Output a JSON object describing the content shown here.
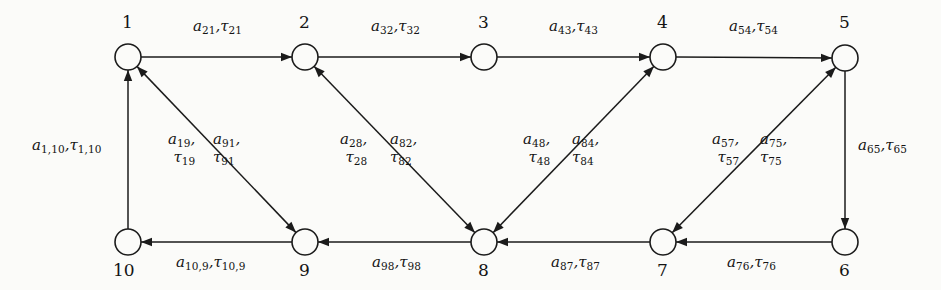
{
  "figure": {
    "type": "directed-graph",
    "background_color": "#fbfbf9",
    "ink_color": "#141414",
    "node_count": 10,
    "edge_count": 16
  },
  "nodes": [
    {
      "id": "1",
      "label": "1",
      "cx": 128,
      "cy": 57,
      "r": 13,
      "label_x": 122,
      "label_y": 14
    },
    {
      "id": "2",
      "label": "2",
      "cx": 305,
      "cy": 57,
      "r": 13,
      "label_x": 299,
      "label_y": 14
    },
    {
      "id": "3",
      "label": "3",
      "cx": 484,
      "cy": 57,
      "r": 13,
      "label_x": 478,
      "label_y": 14
    },
    {
      "id": "4",
      "label": "4",
      "cx": 663,
      "cy": 57,
      "r": 13,
      "label_x": 657,
      "label_y": 14
    },
    {
      "id": "5",
      "label": "5",
      "cx": 845,
      "cy": 58,
      "r": 13,
      "label_x": 839,
      "label_y": 14
    },
    {
      "id": "6",
      "label": "6",
      "cx": 845,
      "cy": 242,
      "r": 13,
      "label_x": 839,
      "label_y": 262
    },
    {
      "id": "7",
      "label": "7",
      "cx": 663,
      "cy": 242,
      "r": 13,
      "label_x": 657,
      "label_y": 262
    },
    {
      "id": "8",
      "label": "8",
      "cx": 484,
      "cy": 242,
      "r": 13,
      "label_x": 478,
      "label_y": 262
    },
    {
      "id": "9",
      "label": "9",
      "cx": 305,
      "cy": 242,
      "r": 13,
      "label_x": 299,
      "label_y": 262
    },
    {
      "id": "10",
      "label": "10",
      "cx": 128,
      "cy": 242,
      "r": 13,
      "label_x": 113,
      "label_y": 262
    }
  ],
  "edges": [
    {
      "id": "e-1-2",
      "from": "1",
      "to": "2",
      "direction": "forward"
    },
    {
      "id": "e-2-3",
      "from": "2",
      "to": "3",
      "direction": "forward"
    },
    {
      "id": "e-3-4",
      "from": "3",
      "to": "4",
      "direction": "forward"
    },
    {
      "id": "e-4-5",
      "from": "4",
      "to": "5",
      "direction": "forward"
    },
    {
      "id": "e-5-6",
      "from": "5",
      "to": "6",
      "direction": "forward"
    },
    {
      "id": "e-6-7",
      "from": "6",
      "to": "7",
      "direction": "forward"
    },
    {
      "id": "e-7-8",
      "from": "7",
      "to": "8",
      "direction": "forward"
    },
    {
      "id": "e-8-9",
      "from": "8",
      "to": "9",
      "direction": "forward"
    },
    {
      "id": "e-9-10",
      "from": "9",
      "to": "10",
      "direction": "forward"
    },
    {
      "id": "e-10-1",
      "from": "10",
      "to": "1",
      "direction": "forward"
    },
    {
      "id": "e-9-1",
      "from": "9",
      "to": "1",
      "direction": "both"
    },
    {
      "id": "e-8-2",
      "from": "8",
      "to": "2",
      "direction": "both"
    },
    {
      "id": "e-8-4",
      "from": "8",
      "to": "4",
      "direction": "both"
    },
    {
      "id": "e-7-5",
      "from": "7",
      "to": "5",
      "direction": "both"
    }
  ],
  "labels": {
    "top": [
      {
        "name": "edge-label-21",
        "a": "a",
        "a_sub": "21",
        "t": "τ",
        "t_sub": "21",
        "x": 193,
        "y": 18
      },
      {
        "name": "edge-label-32",
        "a": "a",
        "a_sub": "32",
        "t": "τ",
        "t_sub": "32",
        "x": 371,
        "y": 18
      },
      {
        "name": "edge-label-43",
        "a": "a",
        "a_sub": "43",
        "t": "τ",
        "t_sub": "43",
        "x": 549,
        "y": 18
      },
      {
        "name": "edge-label-54",
        "a": "a",
        "a_sub": "54",
        "t": "τ",
        "t_sub": "54",
        "x": 729,
        "y": 18
      }
    ],
    "bottom": [
      {
        "name": "edge-label-10-9",
        "a": "a",
        "a_sub": "10,9",
        "t": "τ",
        "t_sub": "10,9",
        "x": 176,
        "y": 254
      },
      {
        "name": "edge-label-98",
        "a": "a",
        "a_sub": "98",
        "t": "τ",
        "t_sub": "98",
        "x": 372,
        "y": 254
      },
      {
        "name": "edge-label-87",
        "a": "a",
        "a_sub": "87",
        "t": "τ",
        "t_sub": "87",
        "x": 551,
        "y": 254
      },
      {
        "name": "edge-label-76",
        "a": "a",
        "a_sub": "76",
        "t": "τ",
        "t_sub": "76",
        "x": 727,
        "y": 254
      }
    ],
    "sides": [
      {
        "name": "edge-label-1-10",
        "a": "a",
        "a_sub": "1,10",
        "t": "τ",
        "t_sub": "1,10",
        "x": 32,
        "y": 137
      },
      {
        "name": "edge-label-65",
        "a": "a",
        "a_sub": "65",
        "t": "τ",
        "t_sub": "65",
        "x": 858,
        "y": 137
      }
    ],
    "diagonals": [
      {
        "name": "edge-label-19",
        "a": "a",
        "a_sub": "19",
        "t": "τ",
        "t_sub": "19",
        "x": 168,
        "y": 131,
        "align": "right"
      },
      {
        "name": "edge-label-91",
        "a": "a",
        "a_sub": "91",
        "t": "τ",
        "t_sub": "91",
        "x": 213,
        "y": 131,
        "align": "left"
      },
      {
        "name": "edge-label-28",
        "a": "a",
        "a_sub": "28",
        "t": "τ",
        "t_sub": "28",
        "x": 340,
        "y": 131,
        "align": "right"
      },
      {
        "name": "edge-label-82",
        "a": "a",
        "a_sub": "82",
        "t": "τ",
        "t_sub": "82",
        "x": 390,
        "y": 131,
        "align": "left"
      },
      {
        "name": "edge-label-48",
        "a": "a",
        "a_sub": "48",
        "t": "τ",
        "t_sub": "48",
        "x": 523,
        "y": 131,
        "align": "right"
      },
      {
        "name": "edge-label-84",
        "a": "a",
        "a_sub": "84",
        "t": "τ",
        "t_sub": "84",
        "x": 572,
        "y": 131,
        "align": "left"
      },
      {
        "name": "edge-label-57",
        "a": "a",
        "a_sub": "57",
        "t": "τ",
        "t_sub": "57",
        "x": 712,
        "y": 131,
        "align": "right"
      },
      {
        "name": "edge-label-75",
        "a": "a",
        "a_sub": "75",
        "t": "τ",
        "t_sub": "75",
        "x": 760,
        "y": 131,
        "align": "left"
      }
    ]
  }
}
